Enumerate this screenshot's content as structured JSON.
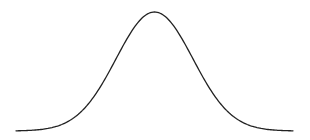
{
  "chart_data": {
    "type": "line",
    "title": "",
    "xlabel": "",
    "ylabel": "",
    "distribution": {
      "name": "normal",
      "mean": 0,
      "std": 1
    },
    "x": [
      -3.6,
      -3.0,
      -2.5,
      -2.0,
      -1.5,
      -1.0,
      -0.5,
      0.0,
      0.5,
      1.0,
      1.5,
      2.0,
      2.5,
      3.0,
      3.6
    ],
    "values": [
      0.0006,
      0.0044,
      0.0175,
      0.054,
      0.1295,
      0.242,
      0.3521,
      0.3989,
      0.3521,
      0.242,
      0.1295,
      0.054,
      0.0175,
      0.0044,
      0.0006
    ],
    "xlim": [
      -3.6,
      3.6
    ],
    "ylim": [
      0,
      0.4
    ],
    "grid": false,
    "axes_visible": false,
    "legend": null,
    "line_color": "#222222",
    "background": "#ffffff"
  }
}
